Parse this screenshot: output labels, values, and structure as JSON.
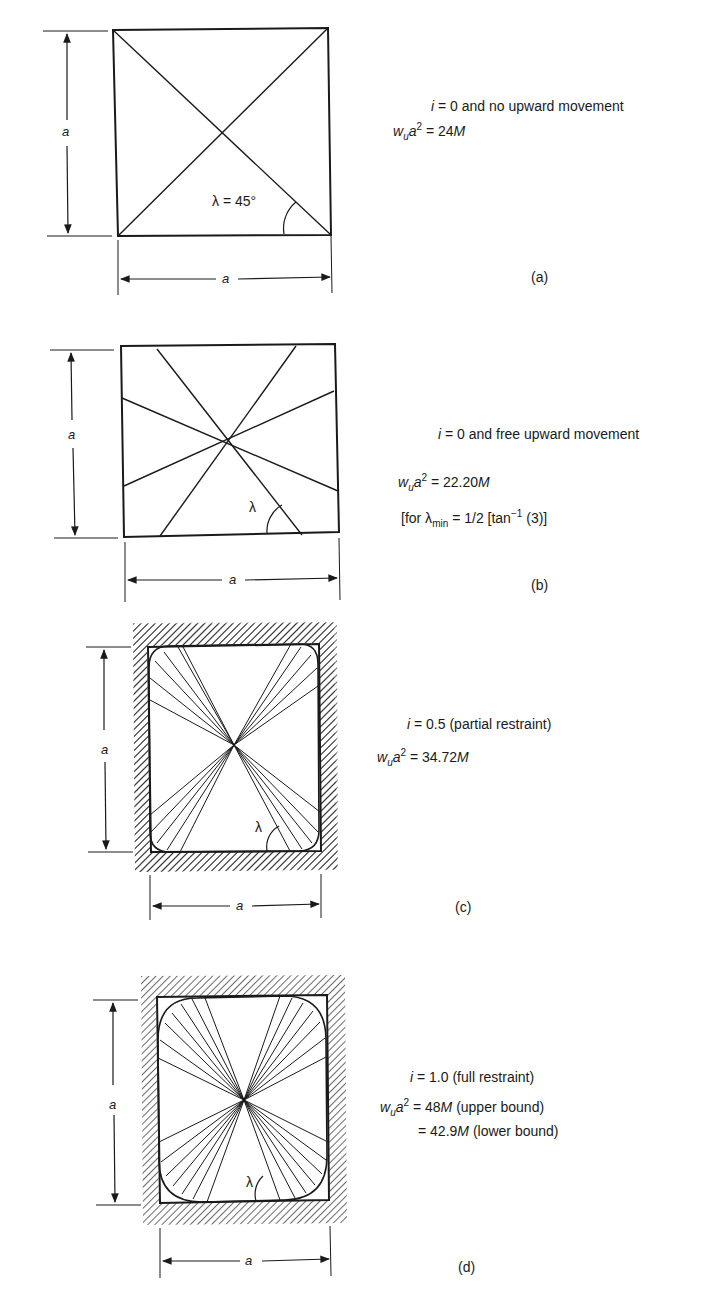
{
  "figure": {
    "panels": [
      {
        "id": "a",
        "caption": "(a)",
        "condition_var": "i",
        "condition_text": " = 0 and no upward movement",
        "eq_lhs_w": "w",
        "eq_lhs_sub": "u",
        "eq_lhs_a": "a",
        "eq_lhs_sup": "2",
        "eq_rhs_num": " = 24",
        "eq_rhs_unit": "M",
        "angle_label": "λ = 45°",
        "dim_vertical": "a",
        "dim_horizontal": "a"
      },
      {
        "id": "b",
        "caption": "(b)",
        "condition_var": "i",
        "condition_text": " = 0 and free upward movement",
        "eq_lhs_w": "w",
        "eq_lhs_sub": "u",
        "eq_lhs_a": "a",
        "eq_lhs_sup": "2",
        "eq_rhs_num": " = 22.20",
        "eq_rhs_unit": "M",
        "note_prefix": "[for λ",
        "note_sub": "min",
        "note_mid": " = 1/2  [tan",
        "note_sup": "−1",
        "note_suffix": " (3)]",
        "angle_label": "λ",
        "dim_vertical": "a",
        "dim_horizontal": "a"
      },
      {
        "id": "c",
        "caption": "(c)",
        "condition_var": "i",
        "condition_text": " = 0.5 (partial restraint)",
        "eq_lhs_w": "w",
        "eq_lhs_sub": "u",
        "eq_lhs_a": "a",
        "eq_lhs_sup": "2",
        "eq_rhs_num": " = 34.72",
        "eq_rhs_unit": "M",
        "angle_label": "λ",
        "dim_vertical": "a",
        "dim_horizontal": "a"
      },
      {
        "id": "d",
        "caption": "(d)",
        "condition_var": "i",
        "condition_text": " = 1.0 (full restraint)",
        "eq_lhs_w": "w",
        "eq_lhs_sub": "u",
        "eq_lhs_a": "a",
        "eq_lhs_sup": "2",
        "eq_rhs_num": " = 48",
        "eq_rhs_unit": "M",
        "eq_rhs_note": " (upper bound)",
        "eq2_num": "= 42.9",
        "eq2_unit": "M",
        "eq2_note": " (lower bound)",
        "angle_label": "λ",
        "dim_vertical": "a",
        "dim_horizontal": "a"
      }
    ],
    "line_color": "#1a1a1a"
  }
}
